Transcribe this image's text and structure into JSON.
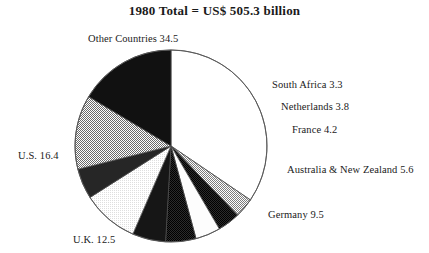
{
  "chart_title": "1980 Total = US$ 505.3 billion",
  "chart_data": {
    "type": "pie",
    "title": "1980 Total = US$ 505.3 billion",
    "unit": "percent of total",
    "total_label": "US$ 505.3 billion",
    "total_value": 505.3,
    "year": 1980,
    "legend_position": "outside-callout-labels",
    "start_angle_deg": -90,
    "direction": "clockwise",
    "labels": [
      "Other Countries",
      "South Africa",
      "Netherlands",
      "France",
      "Australia & New Zealand",
      "Germany",
      "U.K.",
      "U.S."
    ],
    "values": [
      34.5,
      3.3,
      3.8,
      4.2,
      5.6,
      9.5,
      12.5,
      16.4
    ],
    "slices": [
      {
        "name": "Other Countries",
        "label": "Other Countries 34.5",
        "value": 34.5,
        "fill": "white",
        "fill_hex": "#ffffff",
        "label_x": 88,
        "label_y": 33
      },
      {
        "name": "South Africa",
        "label": "South Africa 3.3",
        "value": 3.3,
        "fill": "light-gray-halftone",
        "fill_hex": "#b0b0b0",
        "label_x": 272,
        "label_y": 79
      },
      {
        "name": "Netherlands",
        "label": "Netherlands 3.8",
        "value": 3.8,
        "fill": "dark-gray",
        "fill_hex": "#404040",
        "label_x": 281,
        "label_y": 101
      },
      {
        "name": "France",
        "label": "France 4.2",
        "value": 4.2,
        "fill": "white",
        "fill_hex": "#fafafa",
        "label_x": 292,
        "label_y": 124
      },
      {
        "name": "Australia & New Zealand",
        "label": "Australia & New Zealand 5.6",
        "value": 5.6,
        "fill": "black",
        "fill_hex": "#1a1a1a",
        "label_x": 287,
        "label_y": 164
      },
      {
        "name": "Germany",
        "label": "Germany 9.5",
        "value": 9.5,
        "fill": "very-light-gray",
        "fill_hex": "#f0f0f0",
        "label_x": 268,
        "label_y": 209
      },
      {
        "name": "U.K.",
        "label": "U.K. 12.5",
        "value": 12.5,
        "fill": "medium-gray-halftone",
        "fill_hex": "#a8a8a8",
        "label_x": 73,
        "label_y": 234
      },
      {
        "name": "U.S.",
        "label": "U.S. 16.4",
        "value": 16.4,
        "fill": "black",
        "fill_hex": "#141414",
        "label_x": 18,
        "label_y": 150
      },
      {
        "name": "unlabeled-dark-a",
        "label": "",
        "value": 5.1,
        "fill": "dark-gray",
        "fill_hex": "#3a3a3a"
      },
      {
        "name": "unlabeled-dark-b",
        "label": "",
        "value": 5.1,
        "fill": "dark-gray",
        "fill_hex": "#303030"
      }
    ],
    "geometry": {
      "center_x": 171,
      "center_y": 146,
      "radius": 96
    }
  }
}
